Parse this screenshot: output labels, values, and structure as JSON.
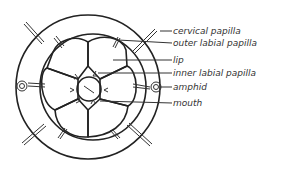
{
  "figure": {
    "type": "anatomical diagram",
    "labels": [
      {
        "id": "cervical-papilla",
        "text": "cervical papilla",
        "y": 31
      },
      {
        "id": "outer-labial-papilla",
        "text": "outer labial papilla",
        "y": 43
      },
      {
        "id": "lip",
        "text": "lip",
        "y": 60
      },
      {
        "id": "inner-labial-papilla",
        "text": "inner labial papilla",
        "y": 73
      },
      {
        "id": "amphid",
        "text": "amphid",
        "y": 87
      },
      {
        "id": "mouth",
        "text": "mouth",
        "y": 103
      }
    ],
    "colors": {
      "line": "#222222",
      "background": "#ffffff",
      "text": "#333333"
    }
  }
}
